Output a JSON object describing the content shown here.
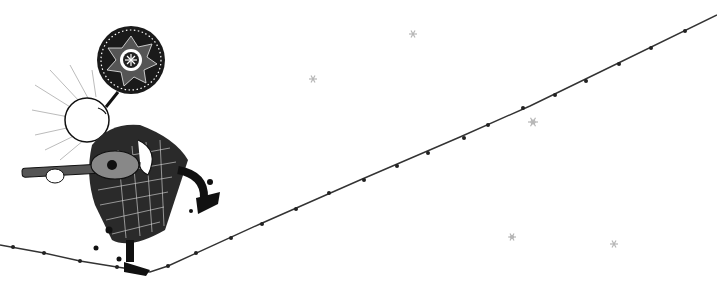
{
  "illustration": {
    "description": "Pen-and-ink drawing of a bald figure in a patterned dress playing a guitar while dancing on a tightrope, with a round ornamental medallion balloon above and faint stars in the background",
    "style": "black ink on white",
    "colors": {
      "background": "#ffffff",
      "ink": "#111111",
      "rope": "#333333",
      "stars": "#b5b5b5"
    },
    "elements": {
      "figure": {
        "label": "guitar-playing dancer"
      },
      "medallion": {
        "label": "ornamental round balloon"
      },
      "rope": {
        "label": "tightrope with knots"
      },
      "stars": {
        "count": 5
      }
    }
  }
}
